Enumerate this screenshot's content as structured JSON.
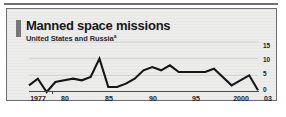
{
  "figure": {
    "title": "Manned space missions",
    "subtitle": "United States and Russia",
    "subtitle_footnote_marker": "a",
    "accent_color": "#76787c",
    "line_color": "#16161a",
    "panel_background": "#ececeb",
    "border_color": "#6c6d70"
  },
  "chart_data": {
    "type": "line",
    "title": "Manned space missions",
    "subtitle": "United States and Russia",
    "xlabel": "",
    "ylabel": "",
    "grid": true,
    "legend": false,
    "ylim": [
      0,
      15
    ],
    "yticks": [
      0,
      5,
      10,
      15
    ],
    "ytick_labels": [
      "0",
      "5",
      "10",
      "15"
    ],
    "xlim": [
      1977,
      2003
    ],
    "xticks": [
      1977,
      1980,
      1985,
      1990,
      1995,
      2000,
      2003
    ],
    "xtick_labels": [
      "1977",
      "80",
      "85",
      "90",
      "95",
      "2000",
      "03"
    ],
    "x": [
      1977,
      1978,
      1979,
      1980,
      1981,
      1982,
      1983,
      1984,
      1985,
      1986,
      1987,
      1988,
      1989,
      1990,
      1991,
      1992,
      1993,
      1994,
      1995,
      1996,
      1997,
      1998,
      1999,
      2000,
      2001,
      2002,
      2003
    ],
    "series": [
      {
        "name": "Manned space missions",
        "color": "#16161a",
        "values": [
          2,
          4,
          0,
          3,
          3.5,
          4,
          3.5,
          4.5,
          10,
          1.5,
          1.5,
          2.5,
          4,
          6.5,
          7.5,
          6.5,
          8,
          6,
          6,
          6,
          6,
          7,
          4.5,
          2,
          3.5,
          5,
          0.5
        ]
      }
    ]
  },
  "yaxis": {
    "ticks": [
      {
        "label": "15",
        "value": 15
      },
      {
        "label": "10",
        "value": 10
      },
      {
        "label": "5",
        "value": 5
      },
      {
        "label": "0",
        "value": 0
      }
    ]
  },
  "xaxis": {
    "ticks": [
      {
        "label": "1977",
        "value": 1977
      },
      {
        "label": "80",
        "value": 1980
      },
      {
        "label": "85",
        "value": 1985
      },
      {
        "label": "90",
        "value": 1990
      },
      {
        "label": "95",
        "value": 1995
      },
      {
        "label": "2000",
        "value": 2000
      },
      {
        "label": "03",
        "value": 2003
      }
    ]
  }
}
